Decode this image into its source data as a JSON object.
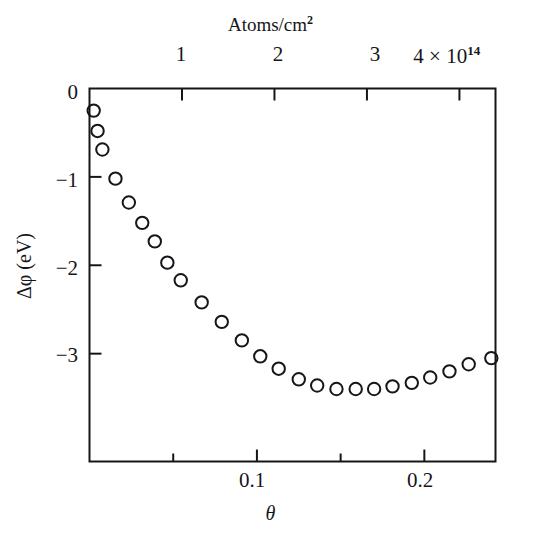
{
  "chart_data": {
    "type": "scatter",
    "title": "",
    "xlabel": "θ",
    "ylabel": "Δφ (eV)",
    "top_axis_label": "Atoms/cm²",
    "top_axis_exponent": "10¹⁴",
    "xlim": [
      0.0,
      0.2425
    ],
    "ylim": [
      -4.22,
      0.0
    ],
    "top_xlim": [
      0.0,
      4.39
    ],
    "grid": false,
    "legend": null,
    "marker": "open-circle",
    "xticks": [
      0.05,
      0.1,
      0.15,
      0.2
    ],
    "xtick_labels": [
      "",
      "0.1",
      "",
      "0.2"
    ],
    "yticks": [
      0,
      -1,
      -2,
      -3
    ],
    "ytick_labels": [
      "0",
      "−1",
      "−2",
      "−3"
    ],
    "top_xticks": [
      1,
      2,
      3,
      4
    ],
    "top_xtick_labels": [
      "1",
      "2",
      "3",
      "4"
    ],
    "x": [
      0.0025,
      0.0048,
      0.0077,
      0.0155,
      0.0235,
      0.0315,
      0.039,
      0.0465,
      0.0545,
      0.067,
      0.079,
      0.091,
      0.102,
      0.113,
      0.125,
      0.136,
      0.1475,
      0.159,
      0.17,
      0.181,
      0.1925,
      0.2035,
      0.215,
      0.2265,
      0.24
    ],
    "y": [
      -0.25,
      -0.48,
      -0.69,
      -1.02,
      -1.29,
      -1.52,
      -1.73,
      -1.97,
      -2.17,
      -2.42,
      -2.64,
      -2.85,
      -3.03,
      -3.17,
      -3.29,
      -3.36,
      -3.4,
      -3.4,
      -3.4,
      -3.37,
      -3.33,
      -3.27,
      -3.2,
      -3.12,
      -3.05
    ],
    "atoms_per_cm2": [
      0.044,
      0.086,
      0.139,
      0.28,
      0.424,
      0.568,
      0.703,
      0.838,
      0.983,
      1.208,
      1.424,
      1.64,
      1.839,
      2.037,
      2.253,
      2.451,
      2.658,
      2.866,
      3.064,
      3.262,
      3.469,
      3.667,
      3.874,
      4.082,
      4.325
    ]
  },
  "axes": {
    "top_title": "Atoms/cm",
    "top_title_sup": "2",
    "top_tick_1": "1",
    "top_tick_2": "2",
    "top_tick_3": "3",
    "top_tick_4": "4 × 10",
    "top_tick_4_exp": "14",
    "y_tick_0": "0",
    "y_tick_1": "−1",
    "y_tick_2": "−2",
    "y_tick_3": "−3",
    "y_title": "Δφ (eV)",
    "x_tick_01": "0.1",
    "x_tick_02": "0.2",
    "x_title": "θ"
  },
  "style": {
    "frame_color": "#16161a",
    "marker_color": "#16161a",
    "background": "#ffffff"
  }
}
